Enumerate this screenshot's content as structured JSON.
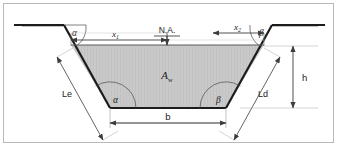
{
  "figure": {
    "frame_color": "#b9b9b9",
    "background_color": "#ffffff",
    "outline_color": "#1c1c1c",
    "fill_color": "#c8c8c8",
    "dimension_color": "#4a4a4a"
  },
  "labels": {
    "angle_top_left": "α",
    "angle_top_right": "β",
    "angle_bottom_left": "α",
    "angle_bottom_right": "β",
    "dim_x1": "x",
    "dim_x1_sub": "1",
    "dim_x2": "x",
    "dim_x2_sub": "2",
    "neutral_axis": "N.A.",
    "area": "A",
    "area_sub": "w",
    "slope_left": "Le",
    "slope_right": "Ld",
    "base_width": "b",
    "height": "h"
  },
  "geometry": {
    "ground_left_y": 25,
    "ground_right_y": 25,
    "top_left_x": 64,
    "top_right_x": 272,
    "water_top_y": 45,
    "water_top_left_x": 71,
    "water_top_right_x": 264,
    "bottom_left_x": 110,
    "bottom_right_x": 226,
    "bottom_y": 108,
    "apex_left_x": 57,
    "apex_right_x": 280
  }
}
